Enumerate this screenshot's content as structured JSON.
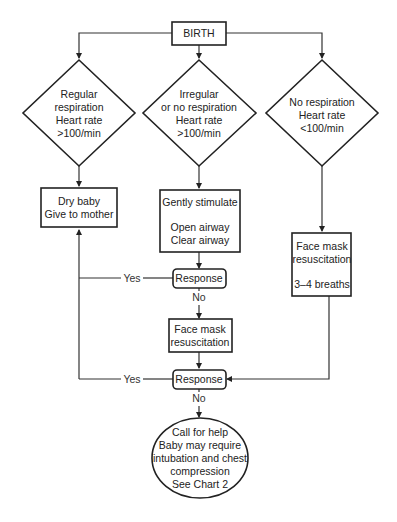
{
  "diagram": {
    "start": {
      "label": "BIRTH"
    },
    "decisions": [
      {
        "lines": [
          "Regular",
          "respiration",
          "Heart rate",
          ">100/min"
        ]
      },
      {
        "lines": [
          "Irregular",
          "or no respiration",
          "Heart rate",
          ">100/min"
        ]
      },
      {
        "lines": [
          "No respiration",
          "Heart rate",
          "<100/min"
        ]
      }
    ],
    "actions": {
      "dry_baby": {
        "lines": [
          "Dry baby",
          "Give to mother"
        ]
      },
      "stimulate": {
        "lines": [
          "Gently stimulate",
          "",
          "Open airway",
          "Clear airway"
        ]
      },
      "face_mask_right": {
        "lines": [
          "Face mask",
          "resuscitation",
          "",
          "3–4 breaths"
        ]
      },
      "face_mask_middle": {
        "lines": [
          "Face mask",
          "resuscitation"
        ]
      }
    },
    "responses": [
      {
        "label": "Response",
        "yes_label": "Yes",
        "no_label": "No"
      },
      {
        "label": "Response",
        "yes_label": "Yes",
        "no_label": "No"
      }
    ],
    "terminal": {
      "lines": [
        "Call for help",
        "Baby may require",
        "intubation and chest",
        "compression",
        "See Chart 2"
      ]
    }
  }
}
